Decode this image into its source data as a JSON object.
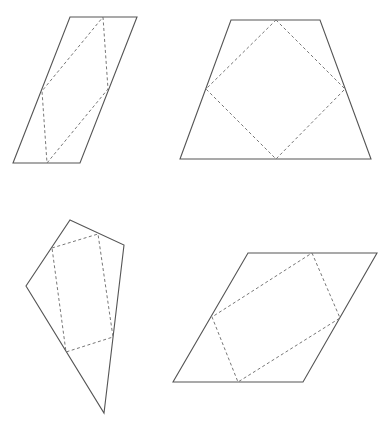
{
  "diagram": {
    "width": 387,
    "height": 430,
    "colors": {
      "outer_stroke": "#555555",
      "inner_stroke": "#777777",
      "background": "#ffffff"
    },
    "shapes": [
      {
        "name": "parallelogram-tall",
        "outer": [
          [
            70,
            17
          ],
          [
            137,
            17
          ],
          [
            80,
            163
          ],
          [
            13,
            163
          ]
        ],
        "inner": [
          [
            103,
            17
          ],
          [
            108,
            89
          ],
          [
            47,
            163
          ],
          [
            42,
            91
          ]
        ]
      },
      {
        "name": "trapezoid",
        "outer": [
          [
            231,
            20
          ],
          [
            320,
            20
          ],
          [
            371,
            159
          ],
          [
            180,
            159
          ]
        ],
        "inner": [
          [
            276,
            20
          ],
          [
            345,
            89
          ],
          [
            276,
            159
          ],
          [
            206,
            89
          ]
        ]
      },
      {
        "name": "quadrilateral-kite",
        "outer": [
          [
            70,
            220
          ],
          [
            124,
            245
          ],
          [
            104,
            413
          ],
          [
            26,
            286
          ]
        ],
        "inner": [
          [
            52,
            248
          ],
          [
            98,
            234
          ],
          [
            113,
            337
          ],
          [
            66,
            352
          ]
        ]
      },
      {
        "name": "parallelogram-wide",
        "outer": [
          [
            248,
            253
          ],
          [
            377,
            253
          ],
          [
            303,
            382
          ],
          [
            173,
            382
          ]
        ],
        "inner": [
          [
            312,
            253
          ],
          [
            340,
            318
          ],
          [
            238,
            382
          ],
          [
            212,
            317
          ]
        ]
      }
    ]
  }
}
